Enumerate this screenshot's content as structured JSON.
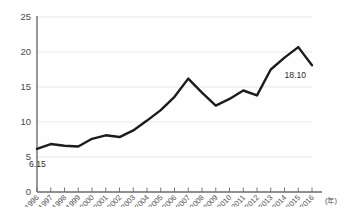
{
  "chart_data": {
    "type": "line",
    "title": "",
    "subtitle": "",
    "xlabel": "(年)",
    "ylabel": "",
    "grid": true,
    "legend": false,
    "xlim": [
      1996,
      2016
    ],
    "ylim": [
      0,
      25
    ],
    "ytick_labels": [
      "25",
      "20",
      "15",
      "10",
      "5",
      "0"
    ],
    "ytick_values": [
      25,
      20,
      15,
      10,
      5,
      0
    ],
    "categories": [
      "1996",
      "1997",
      "1998",
      "1999",
      "2000",
      "2001",
      "2002",
      "2003",
      "2004",
      "2005",
      "2006",
      "2007",
      "2008",
      "2009",
      "2010",
      "2011",
      "2012",
      "2013",
      "2014",
      "2015",
      "2016"
    ],
    "values": [
      6.15,
      6.85,
      6.6,
      6.5,
      7.6,
      8.1,
      7.85,
      8.8,
      10.2,
      11.7,
      13.6,
      16.2,
      14.2,
      12.35,
      13.3,
      14.5,
      13.8,
      17.5,
      19.2,
      20.7,
      18.1
    ],
    "series": [
      {
        "name": "",
        "values": [
          6.15,
          6.85,
          6.6,
          6.5,
          7.6,
          8.1,
          7.85,
          8.8,
          10.2,
          11.7,
          13.6,
          16.2,
          14.2,
          12.35,
          13.3,
          14.5,
          13.8,
          17.5,
          19.2,
          20.7,
          18.1
        ]
      }
    ],
    "annotations": [
      {
        "label": "6.15",
        "category": "1996",
        "value": 6.15
      },
      {
        "label": "18.10",
        "category": "2016",
        "value": 18.1
      }
    ],
    "colors": {
      "line": "#1c1c1c",
      "grid": "#e6e6e6",
      "axis": "#6b6b6b",
      "background": "#fefefe",
      "text": "#4a4a4a"
    }
  }
}
